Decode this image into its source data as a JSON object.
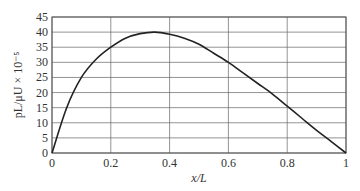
{
  "chart_data": {
    "type": "line",
    "title": "",
    "xlabel": "x/L",
    "ylabel": "pL/μU × 10⁻⁵",
    "xlim": [
      0,
      1
    ],
    "ylim": [
      0,
      45
    ],
    "grid": true,
    "legend": null,
    "x_ticks": [
      "0",
      "0.2",
      "0.4",
      "0.6",
      "0.8",
      "1"
    ],
    "y_ticks": [
      "0",
      "5",
      "10",
      "15",
      "20",
      "25",
      "30",
      "35",
      "40",
      "45"
    ],
    "series": [
      {
        "name": "pressure",
        "x": [
          0,
          0.05,
          0.1,
          0.15,
          0.2,
          0.25,
          0.3,
          0.35,
          0.4,
          0.45,
          0.5,
          0.55,
          0.6,
          0.65,
          0.7,
          0.75,
          0.8,
          0.85,
          0.9,
          0.95,
          1.0
        ],
        "values": [
          0,
          15,
          25,
          31,
          35,
          38,
          39.5,
          40,
          39.3,
          38,
          36,
          33,
          30,
          26.5,
          23,
          19.5,
          15.5,
          11.5,
          7.5,
          3.8,
          0
        ]
      }
    ]
  }
}
